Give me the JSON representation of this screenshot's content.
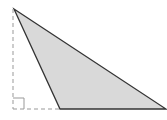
{
  "diagram": {
    "type": "obtuse-triangle-with-height",
    "triangle": {
      "vertices": [
        [
          14,
          9
        ],
        [
          60,
          109
        ],
        [
          166,
          109
        ]
      ],
      "fill": "#d9d9d9",
      "stroke": "#333333"
    },
    "height_line": {
      "from": [
        13,
        9
      ],
      "to": [
        13,
        109
      ],
      "style": "dashed",
      "color": "#999999"
    },
    "base_extension": {
      "from": [
        13,
        109
      ],
      "to": [
        60,
        109
      ],
      "style": "dashed",
      "color": "#999999"
    },
    "right_angle_marker": {
      "corner": [
        13,
        109
      ],
      "size": 11,
      "color": "#999999"
    }
  }
}
